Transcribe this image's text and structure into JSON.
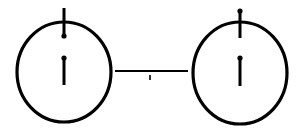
{
  "diagram": {
    "title": "",
    "stroke_color": "#000000",
    "background": "#ffffff",
    "nodes": [
      {
        "id": "left-node",
        "shape": "ellipse",
        "cx": 64,
        "cy": 72,
        "rx": 47,
        "ry": 50,
        "top_stem": {
          "x": 64,
          "y1": 8,
          "y2": 36,
          "dot": "bottom"
        },
        "inner_mark": {
          "x": 64,
          "y1": 58,
          "y2": 85,
          "dot": "top"
        }
      },
      {
        "id": "right-node",
        "shape": "ellipse",
        "cx": 240,
        "cy": 73,
        "rx": 47,
        "ry": 51,
        "top_stem": {
          "x": 240,
          "y1": 11,
          "y2": 38,
          "dot": "top"
        },
        "inner_mark": {
          "x": 240,
          "y1": 58,
          "y2": 86,
          "dot": "top"
        }
      }
    ],
    "edges": [
      {
        "id": "connector",
        "from": "left-node",
        "to": "right-node",
        "x1": 115,
        "x2": 188,
        "y": 71,
        "tick": {
          "x": 150,
          "y1": 75,
          "y2": 80
        }
      }
    ]
  }
}
